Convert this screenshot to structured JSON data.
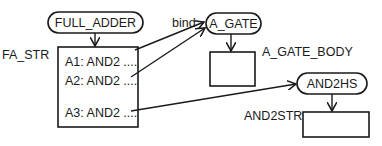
{
  "diagram": {
    "nodes": {
      "full_adder": {
        "label": "FULL_ADDER",
        "shape": "rounded-pill"
      },
      "fa_str": {
        "label": "FA_STR",
        "shape": "box",
        "rows": [
          {
            "label": "A1: AND2 ...."
          },
          {
            "label": "A2: AND2 ...."
          },
          {
            "label": "A3: AND2 ...."
          }
        ]
      },
      "a_gate": {
        "label": "A_GATE",
        "shape": "rounded-pill"
      },
      "a_gate_body": {
        "label": "A_GATE_BODY",
        "shape": "box"
      },
      "and2hs": {
        "label": "AND2HS",
        "shape": "rounded-pill"
      },
      "and2str": {
        "label": "AND2STR",
        "shape": "box"
      }
    },
    "edges": [
      {
        "from": "full_adder",
        "to": "fa_str",
        "label": ""
      },
      {
        "from": "fa_str.row1",
        "to": "a_gate",
        "label": "bind"
      },
      {
        "from": "fa_str.row2",
        "to": "a_gate",
        "label": ""
      },
      {
        "from": "fa_str.row3",
        "to": "and2hs",
        "label": ""
      },
      {
        "from": "a_gate",
        "to": "a_gate_body",
        "label": ""
      },
      {
        "from": "and2hs",
        "to": "and2str",
        "label": ""
      }
    ],
    "colors": {
      "stroke": "#1a1a1a",
      "background": "#ffffff"
    }
  }
}
